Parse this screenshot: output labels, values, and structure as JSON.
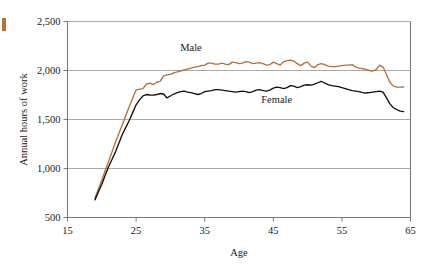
{
  "figure": {
    "name": "annual-hours-of-work-by-age",
    "edge_marker_color": "#b5713a"
  },
  "chart_data": {
    "type": "line",
    "title": "",
    "subtitle": "",
    "xlabel": "Age",
    "ylabel": "Annual hours of work",
    "xlim": [
      15,
      65
    ],
    "ylim": [
      500,
      2500
    ],
    "xticks": [
      15,
      25,
      35,
      45,
      55,
      65
    ],
    "xtick_labels": [
      "15",
      "25",
      "35",
      "45",
      "55",
      "65"
    ],
    "yticks": [
      500,
      1000,
      1500,
      2000,
      2500
    ],
    "ytick_labels": [
      "500",
      "1,000",
      "1,500",
      "2,000",
      "2,500"
    ],
    "grid": "horizontal",
    "legend_position": "inline-annotations",
    "annotations": [
      {
        "text": "Male",
        "x": 33.0,
        "y": 2200,
        "color": "#1a1a1a"
      },
      {
        "text": "Female",
        "x": 45.5,
        "y": 1670,
        "color": "#1a1a1a"
      }
    ],
    "series": [
      {
        "name": "Male",
        "color": "#b5713a",
        "x": [
          19,
          19.5,
          20,
          20.5,
          21,
          21.5,
          22,
          22.5,
          23,
          23.5,
          24,
          24.5,
          25,
          25.5,
          26,
          26.5,
          27,
          27.5,
          28,
          28.5,
          29,
          29.5,
          30,
          30.5,
          31,
          31.5,
          32,
          32.5,
          33,
          33.5,
          34,
          34.5,
          35,
          35.5,
          36,
          36.5,
          37,
          37.5,
          38,
          38.5,
          39,
          39.5,
          40,
          40.5,
          41,
          41.5,
          42,
          42.5,
          43,
          43.5,
          44,
          44.5,
          45,
          45.5,
          46,
          46.5,
          47,
          47.5,
          48,
          48.5,
          49,
          49.5,
          50,
          50.5,
          51,
          51.5,
          52,
          52.5,
          53,
          53.5,
          54,
          54.5,
          55,
          55.5,
          56,
          56.5,
          57,
          57.5,
          58,
          58.5,
          59,
          59.5,
          60,
          60.5,
          61,
          61.5,
          62,
          62.5,
          63,
          63.5,
          64
        ],
        "y": [
          700,
          790,
          880,
          980,
          1075,
          1170,
          1270,
          1360,
          1450,
          1540,
          1630,
          1720,
          1800,
          1810,
          1815,
          1860,
          1870,
          1855,
          1880,
          1890,
          1945,
          1955,
          1960,
          1975,
          1985,
          1995,
          2005,
          2015,
          2025,
          2035,
          2040,
          2050,
          2055,
          2075,
          2075,
          2065,
          2065,
          2075,
          2065,
          2060,
          2085,
          2080,
          2070,
          2075,
          2090,
          2085,
          2070,
          2075,
          2080,
          2070,
          2055,
          2060,
          2085,
          2070,
          2055,
          2090,
          2100,
          2105,
          2095,
          2070,
          2050,
          2075,
          2085,
          2045,
          2030,
          2060,
          2070,
          2060,
          2045,
          2040,
          2040,
          2045,
          2050,
          2055,
          2055,
          2060,
          2035,
          2025,
          2020,
          2010,
          2000,
          1995,
          2010,
          2055,
          2035,
          1960,
          1880,
          1840,
          1830,
          1830,
          1832
        ]
      },
      {
        "name": "Female",
        "color": "#111111",
        "x": [
          19,
          19.5,
          20,
          20.5,
          21,
          21.5,
          22,
          22.5,
          23,
          23.5,
          24,
          24.5,
          25,
          25.5,
          26,
          26.5,
          27,
          27.5,
          28,
          28.5,
          29,
          29.5,
          30,
          30.5,
          31,
          31.5,
          32,
          32.5,
          33,
          33.5,
          34,
          34.5,
          35,
          35.5,
          36,
          36.5,
          37,
          37.5,
          38,
          38.5,
          39,
          39.5,
          40,
          40.5,
          41,
          41.5,
          42,
          42.5,
          43,
          43.5,
          44,
          44.5,
          45,
          45.5,
          46,
          46.5,
          47,
          47.5,
          48,
          48.5,
          49,
          49.5,
          50,
          50.5,
          51,
          51.5,
          52,
          52.5,
          53,
          53.5,
          54,
          54.5,
          55,
          55.5,
          56,
          56.5,
          57,
          57.5,
          58,
          58.5,
          59,
          59.5,
          60,
          60.5,
          61,
          61.5,
          62,
          62.5,
          63,
          63.5,
          64
        ],
        "y": [
          680,
          760,
          840,
          930,
          1020,
          1095,
          1170,
          1260,
          1350,
          1420,
          1490,
          1570,
          1650,
          1700,
          1740,
          1755,
          1750,
          1748,
          1755,
          1765,
          1760,
          1720,
          1740,
          1760,
          1775,
          1785,
          1790,
          1780,
          1775,
          1765,
          1755,
          1765,
          1785,
          1790,
          1795,
          1805,
          1805,
          1800,
          1795,
          1790,
          1785,
          1780,
          1785,
          1790,
          1785,
          1775,
          1785,
          1800,
          1805,
          1795,
          1790,
          1800,
          1820,
          1830,
          1825,
          1815,
          1825,
          1845,
          1840,
          1825,
          1835,
          1850,
          1855,
          1850,
          1860,
          1875,
          1890,
          1870,
          1855,
          1845,
          1840,
          1835,
          1825,
          1815,
          1805,
          1795,
          1790,
          1785,
          1775,
          1770,
          1775,
          1780,
          1785,
          1790,
          1780,
          1720,
          1660,
          1620,
          1600,
          1585,
          1580
        ]
      }
    ]
  }
}
